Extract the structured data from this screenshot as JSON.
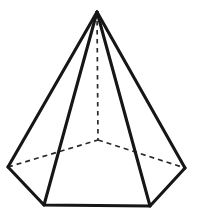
{
  "figure": {
    "name": "heptagonal-pyramid",
    "background_color": "#ffffff",
    "visible_edge_color": "#161616",
    "hidden_edge_color": "#2a2a2a",
    "face_fill_color": "#ffffff",
    "visible_edge_width": 3.1,
    "hidden_edge_width": 1.7,
    "hidden_dash_pattern": "5 4",
    "canvas": {
      "width": 197,
      "height": 220
    },
    "vertices": {
      "apex": {
        "label": "apex",
        "x": 97,
        "y": 12
      },
      "base_left": {
        "label": "left-base-vertex",
        "x": 8,
        "y": 167
      },
      "base_bottom_left": {
        "label": "bottom-left-base-vertex",
        "x": 44,
        "y": 205
      },
      "base_bottom_right": {
        "label": "bottom-right-base-vertex",
        "x": 150,
        "y": 206
      },
      "base_right": {
        "label": "right-base-vertex",
        "x": 185,
        "y": 168
      },
      "base_center": {
        "label": "base-center",
        "x": 98,
        "y": 140
      }
    },
    "visible_edges": [
      {
        "name": "lateral-edge-apex-to-left",
        "from": "apex",
        "to": "base_left"
      },
      {
        "name": "lateral-edge-apex-to-bottom-left",
        "from": "apex",
        "to": "base_bottom_left"
      },
      {
        "name": "lateral-edge-apex-to-bottom-right",
        "from": "apex",
        "to": "base_bottom_right"
      },
      {
        "name": "lateral-edge-apex-to-right",
        "from": "apex",
        "to": "base_right"
      },
      {
        "name": "base-edge-left-to-bottom-left",
        "from": "base_left",
        "to": "base_bottom_left"
      },
      {
        "name": "base-edge-bottom",
        "from": "base_bottom_left",
        "to": "base_bottom_right"
      },
      {
        "name": "base-edge-bottom-right-to-right",
        "from": "base_bottom_right",
        "to": "base_right"
      }
    ],
    "hidden_edges": [
      {
        "name": "hidden-base-edge-left-to-center",
        "from": "base_left",
        "to": "base_center"
      },
      {
        "name": "hidden-base-edge-center-to-right",
        "from": "base_center",
        "to": "base_right"
      },
      {
        "name": "hidden-altitude",
        "from": "apex",
        "to": "base_center"
      }
    ]
  }
}
